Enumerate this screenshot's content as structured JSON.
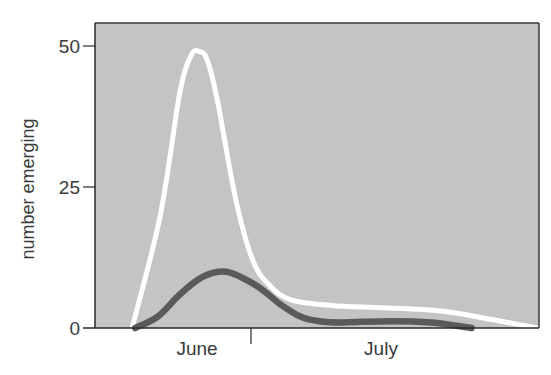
{
  "chart_data": {
    "type": "line",
    "title": "",
    "xlabel": "",
    "ylabel": "number emerging",
    "ylim": [
      0,
      50
    ],
    "xlim_days": [
      0,
      85
    ],
    "yticks": [
      0,
      25,
      50
    ],
    "ytick_labels": [
      "0",
      "25",
      "50"
    ],
    "x_categories": [
      {
        "label": "June",
        "center_day": 19.6
      },
      {
        "label": "July",
        "center_day": 54.8
      }
    ],
    "x_divider_day": 30,
    "grid": false,
    "legend": null,
    "plot_background": "#c4c4c4",
    "series": [
      {
        "name": "white curve",
        "color": "#ffffff",
        "x": [
          7.1,
          12.5,
          16.3,
          18.5,
          20.0,
          21.5,
          23.5,
          26.9,
          30.2,
          33.5,
          37.5,
          45.2,
          55.0,
          66.3,
          76.0,
          84.6
        ],
        "values": [
          0,
          20,
          42,
          48.5,
          49,
          47.5,
          40,
          23,
          12,
          7.5,
          5,
          4,
          3.6,
          3,
          1.5,
          0
        ]
      },
      {
        "name": "dark curve",
        "color": "#5a5a5a",
        "x": [
          7.7,
          12.0,
          16.3,
          20.5,
          24.6,
          28.0,
          31.7,
          35.5,
          39.4,
          43.0,
          47.1,
          56.7,
          64.4,
          68.5,
          72.1
        ],
        "values": [
          0,
          2,
          6,
          9,
          10,
          9,
          7,
          4.2,
          2,
          1.2,
          1,
          1.2,
          1,
          0.5,
          0
        ]
      }
    ]
  },
  "axis": {
    "ylabel": "number emerging",
    "yticks": [
      "0",
      "25",
      "50"
    ],
    "months": [
      "June",
      "July"
    ]
  }
}
